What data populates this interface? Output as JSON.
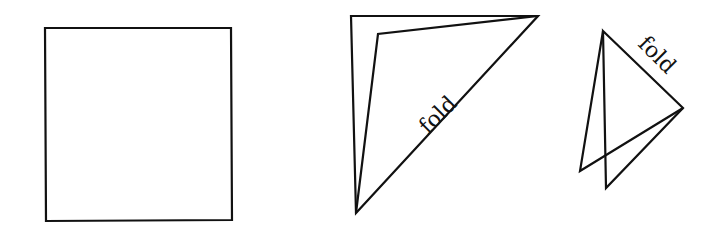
{
  "diagram": {
    "stroke_color": "#111111",
    "background": "#ffffff",
    "figures": [
      {
        "id": "square",
        "polygons": [
          [
            [
              45,
              28
            ],
            [
              231,
              28
            ],
            [
              232,
              220
            ],
            [
              46,
              221
            ]
          ]
        ]
      },
      {
        "id": "first-fold",
        "polygons": [
          [
            [
              351,
              16
            ],
            [
              538,
              16
            ],
            [
              356,
              213
            ]
          ],
          [
            [
              538,
              16
            ],
            [
              378,
              34
            ],
            [
              356,
              213
            ]
          ]
        ],
        "label": {
          "text": "fold",
          "x": 443,
          "y": 120,
          "rotate": -45
        }
      },
      {
        "id": "second-fold",
        "polygons": [
          [
            [
              603,
              31
            ],
            [
              683,
              108
            ],
            [
              606,
              188
            ]
          ],
          [
            [
              603,
              31
            ],
            [
              580,
              171
            ],
            [
              683,
              108
            ]
          ]
        ],
        "label": {
          "text": "fold",
          "x": 650,
          "y": 62,
          "rotate": 45
        }
      }
    ]
  }
}
